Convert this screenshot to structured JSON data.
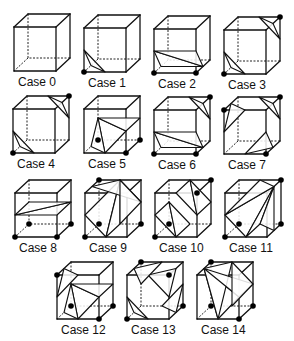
{
  "figure": {
    "colors": {
      "line": "#111111",
      "vertex": "#000000",
      "background": "#ffffff"
    },
    "cube_size": {
      "w": 42,
      "h": 44,
      "depth_dx": 14,
      "depth_dy": 13
    },
    "cases": [
      {
        "label": "Case 0",
        "x": 14,
        "y": 27,
        "vertices": [],
        "triangles": []
      },
      {
        "label": "Case 1",
        "x": 84,
        "y": 28,
        "vertices": [
          0
        ],
        "triangles": [
          [
            [
              0,
              0.5,
              "x"
            ],
            [
              0,
              0.5,
              "y"
            ],
            [
              0,
              0.5,
              "z"
            ]
          ]
        ]
      },
      {
        "label": "Case 2",
        "x": 154,
        "y": 29,
        "vertices": [
          0,
          1
        ],
        "triangles": [
          [
            [
              0,
              0.5,
              "y"
            ],
            [
              0,
              0.5,
              "z"
            ],
            [
              1,
              0.5,
              "z"
            ]
          ],
          [
            [
              0,
              0.5,
              "y"
            ],
            [
              1,
              0.5,
              "z"
            ],
            [
              1,
              0.5,
              "y"
            ]
          ]
        ]
      },
      {
        "label": "Case 3",
        "x": 224,
        "y": 30,
        "vertices": [
          0,
          6
        ],
        "triangles": [
          [
            [
              0,
              0.5,
              "x"
            ],
            [
              0,
              0.5,
              "y"
            ],
            [
              0,
              0.5,
              "z"
            ]
          ],
          [
            [
              6,
              0.5,
              "x"
            ],
            [
              6,
              0.5,
              "y"
            ],
            [
              6,
              0.5,
              "z"
            ]
          ]
        ]
      },
      {
        "label": "Case 4",
        "x": 13,
        "y": 109,
        "vertices": [
          0,
          6
        ],
        "triangles": [
          [
            [
              0,
              0.5,
              "x"
            ],
            [
              0,
              0.5,
              "y"
            ],
            [
              0,
              0.5,
              "z"
            ]
          ],
          [
            [
              6,
              0.5,
              "x"
            ],
            [
              6,
              0.5,
              "y"
            ],
            [
              6,
              0.5,
              "z"
            ]
          ]
        ]
      },
      {
        "label": "Case 5",
        "x": 84,
        "y": 109,
        "vertices": [
          1,
          2,
          3
        ],
        "triangles": [
          [
            [
              1,
              0.5,
              "x"
            ],
            [
              1,
              0.5,
              "y"
            ],
            [
              3,
              0.5,
              "y"
            ]
          ],
          [
            [
              1,
              0.5,
              "x"
            ],
            [
              3,
              0.5,
              "y"
            ],
            [
              3,
              0.5,
              "z"
            ]
          ],
          [
            [
              1,
              0.5,
              "y"
            ],
            [
              2,
              0.5,
              "y"
            ],
            [
              3,
              0.5,
              "y"
            ]
          ]
        ]
      },
      {
        "label": "Case 6",
        "x": 154,
        "y": 110,
        "vertices": [
          0,
          1,
          6
        ],
        "triangles": [
          [
            [
              0,
              0.5,
              "y"
            ],
            [
              0,
              0.5,
              "z"
            ],
            [
              1,
              0.5,
              "z"
            ]
          ],
          [
            [
              0,
              0.5,
              "y"
            ],
            [
              1,
              0.5,
              "z"
            ],
            [
              1,
              0.5,
              "y"
            ]
          ],
          [
            [
              6,
              0.5,
              "x"
            ],
            [
              6,
              0.5,
              "y"
            ],
            [
              6,
              0.5,
              "z"
            ]
          ]
        ]
      },
      {
        "label": "Case 7",
        "x": 224,
        "y": 110,
        "vertices": [
          1,
          6,
          4
        ],
        "triangles": [
          [
            [
              1,
              0.5,
              "x"
            ],
            [
              1,
              0.5,
              "y"
            ],
            [
              1,
              0.5,
              "z"
            ]
          ],
          [
            [
              6,
              0.5,
              "x"
            ],
            [
              6,
              0.5,
              "y"
            ],
            [
              6,
              0.5,
              "z"
            ]
          ],
          [
            [
              4,
              0.5,
              "x"
            ],
            [
              4,
              0.5,
              "y"
            ],
            [
              4,
              0.5,
              "z"
            ]
          ]
        ]
      },
      {
        "label": "Case 8",
        "x": 15,
        "y": 193,
        "vertices": [
          0,
          1,
          2,
          3
        ],
        "triangles": [
          [
            [
              0,
              0.5,
              "y"
            ],
            [
              1,
              0.5,
              "y"
            ],
            [
              2,
              0.5,
              "y"
            ]
          ],
          [
            [
              0,
              0.5,
              "y"
            ],
            [
              2,
              0.5,
              "y"
            ],
            [
              3,
              0.5,
              "y"
            ]
          ]
        ]
      },
      {
        "label": "Case 9",
        "x": 85,
        "y": 193,
        "vertices": [
          0,
          2,
          3,
          7
        ],
        "triangles": [
          [
            [
              0,
              0.5,
              "x"
            ],
            [
              0,
              0.5,
              "y"
            ],
            [
              7,
              0.5,
              "x"
            ]
          ],
          [
            [
              0,
              0.5,
              "x"
            ],
            [
              7,
              0.5,
              "x"
            ],
            [
              2,
              0.5,
              "x"
            ]
          ],
          [
            [
              7,
              0.5,
              "x"
            ],
            [
              7,
              0.5,
              "z"
            ],
            [
              2,
              0.5,
              "y"
            ]
          ],
          [
            [
              2,
              0.5,
              "x"
            ],
            [
              2,
              0.5,
              "y"
            ],
            [
              7,
              0.5,
              "x"
            ]
          ]
        ]
      },
      {
        "label": "Case 10",
        "x": 155,
        "y": 193,
        "vertices": [
          0,
          3,
          5,
          6
        ],
        "triangles": [
          [
            [
              0,
              0.5,
              "x"
            ],
            [
              0,
              0.5,
              "y"
            ],
            [
              3,
              0.5,
              "y"
            ]
          ],
          [
            [
              0,
              0.5,
              "x"
            ],
            [
              3,
              0.5,
              "y"
            ],
            [
              3,
              0.5,
              "x"
            ]
          ],
          [
            [
              1,
              0.5,
              "y"
            ],
            [
              5,
              0.5,
              "x"
            ],
            [
              6,
              0.5,
              "x"
            ]
          ],
          [
            [
              1,
              0.5,
              "y"
            ],
            [
              6,
              0.5,
              "x"
            ],
            [
              2,
              0.5,
              "y"
            ]
          ]
        ]
      },
      {
        "label": "Case 11",
        "x": 225,
        "y": 193,
        "vertices": [
          0,
          2,
          3,
          6
        ],
        "triangles": [
          [
            [
              0,
              0.5,
              "x"
            ],
            [
              0,
              0.5,
              "y"
            ],
            [
              6,
              0.5,
              "z"
            ]
          ],
          [
            [
              0,
              0.5,
              "x"
            ],
            [
              6,
              0.5,
              "z"
            ],
            [
              2,
              0.5,
              "x"
            ]
          ],
          [
            [
              0,
              0.5,
              "y"
            ],
            [
              6,
              0.5,
              "x"
            ],
            [
              6,
              0.5,
              "z"
            ]
          ],
          [
            [
              2,
              0.5,
              "x"
            ],
            [
              6,
              0.5,
              "z"
            ],
            [
              2,
              0.5,
              "z"
            ]
          ]
        ]
      },
      {
        "label": "Case 12",
        "x": 57,
        "y": 275,
        "vertices": [
          1,
          2,
          3,
          4
        ],
        "triangles": [
          [
            [
              1,
              0.5,
              "x"
            ],
            [
              1,
              0.5,
              "y"
            ],
            [
              3,
              0.5,
              "y"
            ]
          ],
          [
            [
              1,
              0.5,
              "x"
            ],
            [
              3,
              0.5,
              "y"
            ],
            [
              3,
              0.5,
              "z"
            ]
          ],
          [
            [
              1,
              0.5,
              "y"
            ],
            [
              2,
              0.5,
              "y"
            ],
            [
              3,
              0.5,
              "y"
            ]
          ],
          [
            [
              4,
              0.5,
              "x"
            ],
            [
              4,
              0.5,
              "y"
            ],
            [
              4,
              0.5,
              "z"
            ]
          ]
        ]
      },
      {
        "label": "Case 13",
        "x": 127,
        "y": 275,
        "vertices": [
          0,
          2,
          5,
          7
        ],
        "triangles": [
          [
            [
              0,
              0.5,
              "x"
            ],
            [
              0,
              0.5,
              "y"
            ],
            [
              0,
              0.5,
              "z"
            ]
          ],
          [
            [
              2,
              0.5,
              "x"
            ],
            [
              2,
              0.5,
              "y"
            ],
            [
              2,
              0.5,
              "z"
            ]
          ],
          [
            [
              5,
              0.5,
              "x"
            ],
            [
              5,
              0.5,
              "y"
            ],
            [
              5,
              0.5,
              "z"
            ]
          ],
          [
            [
              7,
              0.5,
              "x"
            ],
            [
              7,
              0.5,
              "y"
            ],
            [
              7,
              0.5,
              "z"
            ]
          ]
        ]
      },
      {
        "label": "Case 14",
        "x": 197,
        "y": 275,
        "vertices": [
          1,
          2,
          3,
          7
        ],
        "triangles": [
          [
            [
              1,
              0.5,
              "x"
            ],
            [
              1,
              0.5,
              "y"
            ],
            [
              7,
              0.5,
              "z"
            ]
          ],
          [
            [
              1,
              0.5,
              "x"
            ],
            [
              7,
              0.5,
              "z"
            ],
            [
              7,
              0.5,
              "x"
            ]
          ],
          [
            [
              1,
              0.5,
              "y"
            ],
            [
              2,
              0.5,
              "y"
            ],
            [
              7,
              0.5,
              "z"
            ]
          ],
          [
            [
              2,
              0.5,
              "y"
            ],
            [
              2,
              0.5,
              "x"
            ],
            [
              7,
              0.5,
              "x"
            ]
          ]
        ]
      }
    ]
  }
}
